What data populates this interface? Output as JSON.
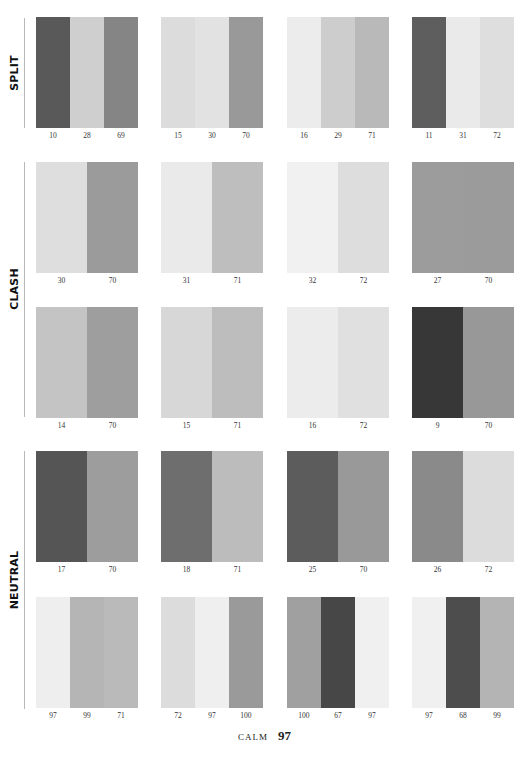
{
  "sections": [
    {
      "label": "SPLIT",
      "rule_top": 18,
      "rule_bottom": 128,
      "label_center": 73
    },
    {
      "label": "CLASH",
      "rule_top": 162,
      "rule_bottom": 417,
      "label_center": 289
    },
    {
      "label": "NEUTRAL",
      "rule_top": 451,
      "rule_bottom": 709,
      "label_center": 580
    }
  ],
  "rows": [
    {
      "top": 17,
      "section": "SPLIT",
      "swatches": [
        {
          "stripes": [
            {
              "num": "10",
              "color": "#595959"
            },
            {
              "num": "28",
              "color": "#cfcfcf"
            },
            {
              "num": "69",
              "color": "#858585"
            }
          ]
        },
        {
          "stripes": [
            {
              "num": "15",
              "color": "#dcdcdc"
            },
            {
              "num": "30",
              "color": "#e2e2e2"
            },
            {
              "num": "70",
              "color": "#999999"
            }
          ]
        },
        {
          "stripes": [
            {
              "num": "16",
              "color": "#ececec"
            },
            {
              "num": "29",
              "color": "#cdcdcd"
            },
            {
              "num": "71",
              "color": "#b9b9b9"
            }
          ]
        },
        {
          "stripes": [
            {
              "num": "11",
              "color": "#5e5e5e"
            },
            {
              "num": "31",
              "color": "#eaeaea"
            },
            {
              "num": "72",
              "color": "#dedede"
            }
          ]
        }
      ]
    },
    {
      "top": 162,
      "section": "CLASH",
      "swatches": [
        {
          "stripes": [
            {
              "num": "30",
              "color": "#dedede"
            },
            {
              "num": "70",
              "color": "#9b9b9b"
            }
          ]
        },
        {
          "stripes": [
            {
              "num": "31",
              "color": "#eaeaea"
            },
            {
              "num": "71",
              "color": "#bebebe"
            }
          ]
        },
        {
          "stripes": [
            {
              "num": "32",
              "color": "#f1f1f1"
            },
            {
              "num": "72",
              "color": "#dddddd"
            }
          ]
        },
        {
          "stripes": [
            {
              "num": "27",
              "color": "#9c9c9c"
            },
            {
              "num": "70",
              "color": "#9b9b9b"
            }
          ]
        }
      ]
    },
    {
      "top": 307,
      "section": "CLASH",
      "swatches": [
        {
          "stripes": [
            {
              "num": "14",
              "color": "#c4c4c4"
            },
            {
              "num": "70",
              "color": "#9e9e9e"
            }
          ]
        },
        {
          "stripes": [
            {
              "num": "15",
              "color": "#d7d7d7"
            },
            {
              "num": "71",
              "color": "#bdbdbd"
            }
          ]
        },
        {
          "stripes": [
            {
              "num": "16",
              "color": "#ececec"
            },
            {
              "num": "72",
              "color": "#e0e0e0"
            }
          ]
        },
        {
          "stripes": [
            {
              "num": "9",
              "color": "#373737"
            },
            {
              "num": "70",
              "color": "#989898"
            }
          ]
        }
      ]
    },
    {
      "top": 451,
      "section": "NEUTRAL",
      "swatches": [
        {
          "stripes": [
            {
              "num": "17",
              "color": "#555555"
            },
            {
              "num": "70",
              "color": "#9d9d9d"
            }
          ]
        },
        {
          "stripes": [
            {
              "num": "18",
              "color": "#6e6e6e"
            },
            {
              "num": "71",
              "color": "#bcbcbc"
            }
          ]
        },
        {
          "stripes": [
            {
              "num": "25",
              "color": "#5c5c5c"
            },
            {
              "num": "70",
              "color": "#999999"
            }
          ]
        },
        {
          "stripes": [
            {
              "num": "26",
              "color": "#8a8a8a"
            },
            {
              "num": "72",
              "color": "#dcdcdc"
            }
          ]
        }
      ]
    },
    {
      "top": 597,
      "section": "NEUTRAL",
      "swatches": [
        {
          "stripes": [
            {
              "num": "97",
              "color": "#eeeeee"
            },
            {
              "num": "99",
              "color": "#b5b5b5"
            },
            {
              "num": "71",
              "color": "#bababa"
            }
          ]
        },
        {
          "stripes": [
            {
              "num": "72",
              "color": "#dcdcdc"
            },
            {
              "num": "97",
              "color": "#efefef"
            },
            {
              "num": "100",
              "color": "#9a9a9a"
            }
          ]
        },
        {
          "stripes": [
            {
              "num": "100",
              "color": "#a0a0a0"
            },
            {
              "num": "67",
              "color": "#474747"
            },
            {
              "num": "97",
              "color": "#f0f0f0"
            }
          ]
        },
        {
          "stripes": [
            {
              "num": "97",
              "color": "#f0f0f0"
            },
            {
              "num": "68",
              "color": "#4d4d4d"
            },
            {
              "num": "99",
              "color": "#b4b4b4"
            }
          ]
        }
      ]
    }
  ],
  "footer": {
    "section_name": "CALM",
    "page_number": "97"
  }
}
